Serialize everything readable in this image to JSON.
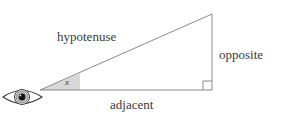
{
  "diagram": {
    "labels": {
      "hypotenuse": "hypotenuse",
      "opposite": "opposite",
      "adjacent": "adjacent",
      "angle": "x"
    },
    "icons": {
      "eye": "eye-icon",
      "right_angle": "right-angle-marker-icon",
      "angle_wedge": "angle-wedge-icon"
    },
    "colors": {
      "stroke": "#8a8a8a",
      "label_text": "#3a3a3a",
      "wedge_fill": "#d8d8d8",
      "eye_stroke": "#3a3a3a",
      "iris_fill": "#b8b8b8",
      "pupil_fill": "#1a1a1a",
      "background": "#ffffff"
    },
    "geometry": {
      "vertex_angle": [
        40,
        90
      ],
      "vertex_right": [
        212,
        90
      ],
      "vertex_apex": [
        212,
        14
      ],
      "right_angle_box_size": 9,
      "wedge_extent_x": 80
    }
  }
}
